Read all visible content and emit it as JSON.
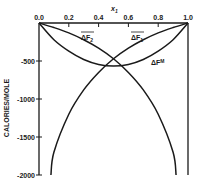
{
  "chart_data": {
    "type": "line",
    "title": "",
    "xlabel": "x₁",
    "ylabel": "CALORIES/MOLE",
    "xlim": [
      0.0,
      1.0
    ],
    "ylim": [
      -2000,
      0
    ],
    "x_axis_position": "top",
    "grid": false,
    "legend": "none (curves labeled inline)",
    "x_ticks": [
      "0.0",
      "0.2",
      "0.4",
      "0.6",
      "0.8",
      "1.0"
    ],
    "y_ticks": [
      "-500",
      "-1000",
      "-1500",
      "-2000"
    ],
    "series": [
      {
        "name": "ΔF̄₂",
        "label_text": "ΔF₂",
        "x": [
          0.0,
          0.1,
          0.2,
          0.3,
          0.4,
          0.5,
          0.6,
          0.7,
          0.8,
          0.9,
          0.92
        ],
        "values": [
          0,
          -60,
          -130,
          -220,
          -330,
          -470,
          -650,
          -880,
          -1200,
          -1700,
          -2000
        ]
      },
      {
        "name": "ΔF̄₁",
        "label_text": "ΔF₁",
        "x": [
          0.08,
          0.1,
          0.2,
          0.3,
          0.4,
          0.5,
          0.6,
          0.7,
          0.8,
          0.9,
          1.0
        ],
        "values": [
          -2000,
          -1700,
          -1200,
          -880,
          -650,
          -470,
          -330,
          -220,
          -130,
          -60,
          0
        ]
      },
      {
        "name": "ΔFᴹ",
        "label_text": "ΔFᴹ",
        "x": [
          0.0,
          0.1,
          0.2,
          0.3,
          0.4,
          0.5,
          0.6,
          0.7,
          0.8,
          0.9,
          1.0
        ],
        "values": [
          0,
          -220,
          -370,
          -480,
          -545,
          -565,
          -545,
          -480,
          -370,
          -220,
          0
        ]
      }
    ],
    "annotations": [
      {
        "text": "ΔF₂ (with overbar)",
        "near_x": 0.42,
        "near_y": -90
      },
      {
        "text": "ΔF₁ (with overbar)",
        "near_x": 0.65,
        "near_y": -90
      },
      {
        "text": "ΔFᴹ",
        "near_x": 0.82,
        "near_y": -560
      }
    ]
  },
  "labels": {
    "x_title": "x",
    "x_sub": "1",
    "y_title": "CALORIES/MOLE",
    "dF2_main": "ΔF",
    "dF2_sub": "2",
    "dF1_main": "ΔF",
    "dF1_sub": "1",
    "dFM_main": "ΔF",
    "dFM_sup": "M"
  }
}
